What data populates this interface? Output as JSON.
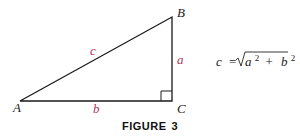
{
  "figure": {
    "caption_word": "FIGURE",
    "caption_number": "3",
    "vertices": {
      "A": "A",
      "B": "B",
      "C": "C"
    },
    "sides": {
      "a": "a",
      "b": "b",
      "c": "c"
    },
    "formula": {
      "lhs": "c",
      "eq": "=",
      "radicand_a": "a",
      "exp_a": "2",
      "plus": "+",
      "radicand_b": "b",
      "exp_b": "2"
    },
    "colors": {
      "line": "#1a1a1a",
      "side_label": "#b0385a",
      "text": "#222222"
    }
  }
}
